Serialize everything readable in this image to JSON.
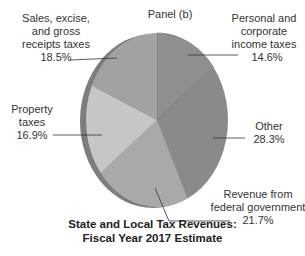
{
  "chart_data": {
    "type": "pie",
    "title": "State and Local Tax Revenues: Fiscal Year 2017 Estimate",
    "subtitle": "Panel (b)",
    "categories": [
      "Personal and corporate income taxes",
      "Other",
      "Revenue from federal government",
      "Property taxes",
      "Sales, excise, and gross receipts taxes"
    ],
    "values": [
      14.6,
      28.3,
      21.7,
      16.9,
      18.5
    ],
    "unit": "%",
    "colors": [
      "#8f8f8f",
      "#8a8a8a",
      "#a9a9a9",
      "#c6c6c6",
      "#a2a2a2"
    ]
  },
  "panel_label": "Panel (b)",
  "labels": {
    "income": {
      "line1": "Personal and",
      "line2": "corporate",
      "line3": "income taxes",
      "value": "14.6%"
    },
    "other": {
      "line1": "Other",
      "value": "28.3%"
    },
    "federal": {
      "line1": "Revenue from",
      "line2": "federal government",
      "value": "21.7%"
    },
    "property": {
      "line1": "Property",
      "line2": "taxes",
      "value": "16.9%"
    },
    "sales": {
      "line1": "Sales, excise,",
      "line2": "and gross",
      "line3": "receipts taxes",
      "value": "18.5%"
    }
  },
  "title": {
    "line1": "State and Local Tax Revenues:",
    "line2": "Fiscal Year 2017 Estimate"
  }
}
